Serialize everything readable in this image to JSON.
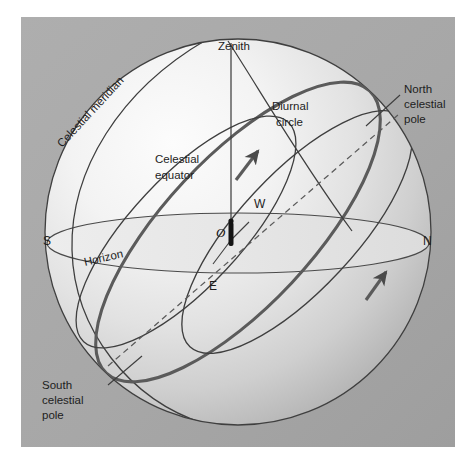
{
  "figure": {
    "background_color": "#ffffff",
    "panel_color": "#a9a9a9",
    "sphere_light_color": "#f2f2f2",
    "sphere_shadow_color": "#b4b4b4",
    "horizon_plane_color": "#e8e8e8",
    "line_color": "#3c3c3c",
    "arc_color": "#555555",
    "text_color": "#1d1d1d"
  },
  "labels": {
    "zenith": "Zenith",
    "diurnal_circle_line1": "Diurnal",
    "diurnal_circle_line2": "circle",
    "north_pole_line1": "North",
    "north_pole_line2": "celestial",
    "north_pole_line3": "pole",
    "south_pole_line1": "South",
    "south_pole_line2": "celestial",
    "south_pole_line3": "pole",
    "celestial_meridian": "Celestial meridian",
    "celestial_equator_line1": "Celestial",
    "celestial_equator_line2": "equator",
    "horizon": "Horizon",
    "observer": "O",
    "cardinal_south": "S",
    "cardinal_north": "N",
    "cardinal_west": "W",
    "cardinal_east": "E"
  }
}
